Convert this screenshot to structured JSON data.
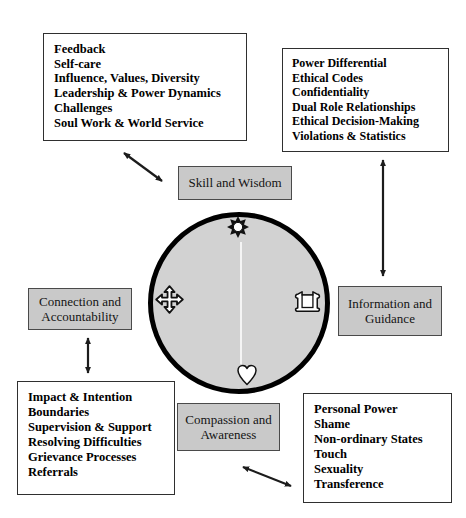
{
  "colors": {
    "page_bg": "#ffffff",
    "text_color": "#000000",
    "list_box_fill": "#ffffff",
    "list_box_border": "#2f2f2f",
    "label_box_fill": "#c9c9c9",
    "label_box_border": "#4a4a4a",
    "circle_fill": "#d2d2d2",
    "circle_border": "#000000",
    "arrow_color": "#1c1c1c",
    "icon_stroke": "#111111"
  },
  "boxes": {
    "top_left": {
      "items": [
        "Feedback",
        "Self-care",
        "Influence, Values, Diversity",
        "Leadership & Power Dynamics",
        "Challenges",
        "Soul Work & World Service"
      ]
    },
    "top_right": {
      "items": [
        "Power Differential",
        "Ethical Codes",
        "Confidentiality",
        "Dual Role Relationships",
        "Ethical Decision-Making",
        "Violations & Statistics"
      ]
    },
    "bottom_left": {
      "items": [
        "Impact & Intention",
        "Boundaries",
        "Supervision & Support",
        "Resolving Difficulties",
        "Grievance Processes",
        "Referrals"
      ]
    },
    "bottom_right": {
      "items": [
        "Personal Power",
        "Shame",
        "Non-ordinary States",
        "Touch",
        "Sexuality",
        "Transference"
      ]
    }
  },
  "labels": {
    "top": "Skill and Wisdom",
    "left": "Connection and Accountability",
    "right": "Information and Guidance",
    "bottom": "Compassion and Awareness"
  },
  "icons": {
    "top": "sun-icon",
    "left": "move-arrows-icon",
    "right": "scroll-icon",
    "bottom": "heart-icon"
  }
}
